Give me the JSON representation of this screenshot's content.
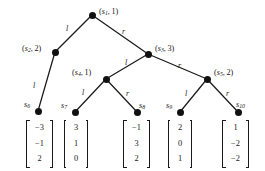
{
  "figure": {
    "type": "binary-decision-tree",
    "width": 265,
    "height": 171,
    "background": "#ffffff",
    "ink_color": "#1a1a1a"
  },
  "nodes": [
    {
      "id": "s1",
      "label": "(s₁, 1)",
      "state": "s",
      "index": "1",
      "value": "1",
      "x": 92,
      "y": 15,
      "label_x": 99,
      "label_y": 8,
      "kind": "internal"
    },
    {
      "id": "s2",
      "label": "(s₂, 2)",
      "state": "s",
      "index": "2",
      "value": "2",
      "x": 55,
      "y": 52,
      "label_x": 22,
      "label_y": 45,
      "kind": "internal"
    },
    {
      "id": "s3",
      "label": "(s₃, 3)",
      "state": "s",
      "index": "3",
      "value": "3",
      "x": 148,
      "y": 54,
      "label_x": 155,
      "label_y": 45,
      "kind": "internal"
    },
    {
      "id": "s4",
      "label": "(s₄, 1)",
      "state": "s",
      "index": "4",
      "value": "1",
      "x": 106,
      "y": 79,
      "label_x": 72,
      "label_y": 69,
      "kind": "internal"
    },
    {
      "id": "s5",
      "label": "(s₅, 2)",
      "state": "s",
      "index": "5",
      "value": "2",
      "x": 207,
      "y": 79,
      "label_x": 214,
      "label_y": 69,
      "kind": "internal"
    },
    {
      "id": "s6",
      "label": "s₆",
      "state": "s",
      "index": "6",
      "x": 38,
      "y": 111,
      "label_x": 24,
      "label_y": 101,
      "kind": "leaf"
    },
    {
      "id": "s7",
      "label": "s₇",
      "state": "s",
      "index": "7",
      "x": 75,
      "y": 112,
      "label_x": 61,
      "label_y": 102,
      "kind": "leaf"
    },
    {
      "id": "s8",
      "label": "s₈",
      "state": "s",
      "index": "8",
      "x": 137,
      "y": 112,
      "label_x": 139,
      "label_y": 102,
      "kind": "leaf"
    },
    {
      "id": "s9",
      "label": "s₉",
      "state": "s",
      "index": "9",
      "x": 180,
      "y": 112,
      "label_x": 166,
      "label_y": 102,
      "kind": "leaf"
    },
    {
      "id": "s10",
      "label": "s₁₀",
      "state": "s",
      "index": "10",
      "x": 238,
      "y": 112,
      "label_x": 236,
      "label_y": 101,
      "kind": "leaf"
    }
  ],
  "edges": [
    {
      "from": "s1",
      "to": "s2",
      "label": "l",
      "x1": 92,
      "y1": 15,
      "x2": 55,
      "y2": 52,
      "label_x": 66,
      "label_y": 25
    },
    {
      "from": "s1",
      "to": "s3",
      "label": "r",
      "x1": 92,
      "y1": 15,
      "x2": 148,
      "y2": 54,
      "label_x": 122,
      "label_y": 28
    },
    {
      "from": "s2",
      "to": "s6",
      "label": "l",
      "x1": 55,
      "y1": 52,
      "x2": 38,
      "y2": 111,
      "label_x": 33,
      "label_y": 82
    },
    {
      "from": "s3",
      "to": "s4",
      "label": "l",
      "x1": 148,
      "y1": 54,
      "x2": 106,
      "y2": 79,
      "label_x": 125,
      "label_y": 59
    },
    {
      "from": "s3",
      "to": "s5",
      "label": "r",
      "x1": 148,
      "y1": 54,
      "x2": 207,
      "y2": 79,
      "label_x": 178,
      "label_y": 62
    },
    {
      "from": "s4",
      "to": "s7",
      "label": "l",
      "x1": 106,
      "y1": 79,
      "x2": 75,
      "y2": 112,
      "label_x": 82,
      "label_y": 89
    },
    {
      "from": "s4",
      "to": "s8",
      "label": "r",
      "x1": 106,
      "y1": 79,
      "x2": 137,
      "y2": 112,
      "label_x": 126,
      "label_y": 90
    },
    {
      "from": "s5",
      "to": "s9",
      "label": "l",
      "x1": 207,
      "y1": 79,
      "x2": 180,
      "y2": 112,
      "label_x": 185,
      "label_y": 90
    },
    {
      "from": "s5",
      "to": "s10",
      "label": "r",
      "x1": 207,
      "y1": 79,
      "x2": 238,
      "y2": 112,
      "label_x": 226,
      "label_y": 90
    }
  ],
  "vectors": [
    {
      "node": "s6",
      "values": [
        "−3",
        "−1",
        "2"
      ],
      "x": 26,
      "y": 120,
      "width": 27,
      "height": 48
    },
    {
      "node": "s7",
      "values": [
        "3",
        "1",
        "0"
      ],
      "x": 64,
      "y": 120,
      "width": 24,
      "height": 48
    },
    {
      "node": "s8",
      "values": [
        "−1",
        "3",
        "2"
      ],
      "x": 123,
      "y": 120,
      "width": 27,
      "height": 48
    },
    {
      "node": "s9",
      "values": [
        "2",
        "0",
        "1"
      ],
      "x": 168,
      "y": 120,
      "width": 24,
      "height": 48
    },
    {
      "node": "s10",
      "values": [
        "1",
        "−2",
        "−2"
      ],
      "x": 222,
      "y": 120,
      "width": 27,
      "height": 48
    }
  ]
}
